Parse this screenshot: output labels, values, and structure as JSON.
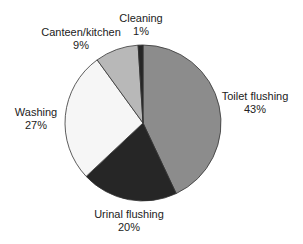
{
  "chart_data": {
    "type": "pie",
    "title": "",
    "categories": [
      "Toilet flushing",
      "Urinal flushing",
      "Washing",
      "Canteen/kitchen",
      "Cleaning"
    ],
    "values": [
      43,
      20,
      27,
      9,
      1
    ],
    "unit": "%",
    "colors": [
      "#8c8c8c",
      "#262626",
      "#f6f6f6",
      "#b8b8b8",
      "#262626"
    ],
    "start_angle": "12 o'clock",
    "direction": "clockwise",
    "labels": [
      {
        "name": "Toilet flushing",
        "pct": "43%"
      },
      {
        "name": "Urinal flushing",
        "pct": "20%"
      },
      {
        "name": "Washing",
        "pct": "27%"
      },
      {
        "name": "Canteen/kitchen",
        "pct": "9%"
      },
      {
        "name": "Cleaning",
        "pct": "1%"
      }
    ]
  }
}
